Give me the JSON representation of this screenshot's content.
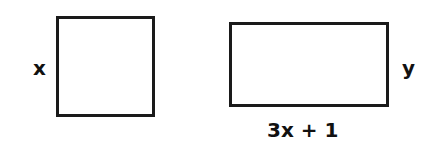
{
  "diagram": {
    "square": {
      "side_label": "x"
    },
    "rectangle": {
      "height_label": "y",
      "width_label": "3x + 1"
    },
    "colors": {
      "stroke": "#1a1a1a",
      "background": "#ffffff"
    }
  }
}
